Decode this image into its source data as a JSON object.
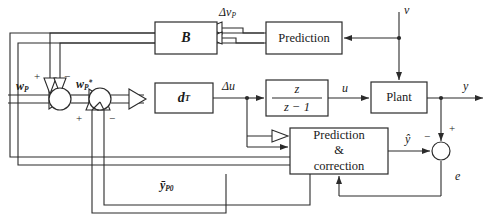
{
  "diagram": {
    "line_color": "#2b2b2b",
    "background": "#ffffff",
    "blocks": [
      {
        "id": "b",
        "label": "B",
        "x": 155,
        "y": 22,
        "w": 62,
        "h": 32
      },
      {
        "id": "prediction",
        "label": "Prediction",
        "x": 266,
        "y": 22,
        "w": 76,
        "h": 32
      },
      {
        "id": "dt",
        "label": "dᵀ",
        "x": 155,
        "y": 83,
        "w": 58,
        "h": 30
      },
      {
        "id": "integrator",
        "label": "z / (z − 1)",
        "x": 266,
        "y": 80,
        "w": 62,
        "h": 36
      },
      {
        "id": "plant",
        "label": "Plant",
        "x": 371,
        "y": 82,
        "w": 56,
        "h": 31
      },
      {
        "id": "predcorr",
        "label": "Prediction\n&\ncorrection",
        "x": 290,
        "y": 128,
        "w": 98,
        "h": 46
      }
    ],
    "junctions": [
      {
        "id": "sum1",
        "cx": 60,
        "cy": 99,
        "r": 11
      },
      {
        "id": "sum2",
        "cx": 100,
        "cy": 99,
        "r": 11
      },
      {
        "id": "sum3",
        "cx": 441,
        "cy": 151,
        "r": 9
      }
    ],
    "signals": {
      "wp": "wₚ",
      "wp_star": "wₚ*",
      "delta_vp": "Δvₚ",
      "delta_u": "Δu",
      "u": "u",
      "v": "v",
      "y": "y",
      "y_hat": "ŷ",
      "e": "e",
      "y_bar_p0": "ȳₚ₀"
    },
    "signs": {
      "sum1_plus": "+",
      "sum1_minus": "−",
      "sum2_plus": "+",
      "sum2_minus": "−",
      "sum3_plus": "+",
      "sum3_minus": "−"
    },
    "numerator": "z",
    "denominator": "z − 1"
  }
}
